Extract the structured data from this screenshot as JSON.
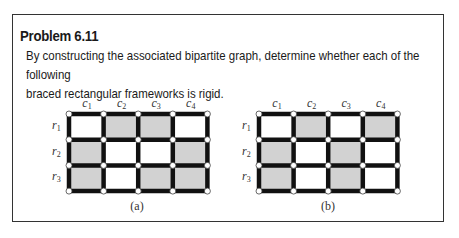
{
  "problem": {
    "title": "Problem 6.11",
    "text_lines": [
      "By constructing the associated bipartite graph, determine whether each of the following",
      "braced rectangular frameworks is rigid."
    ]
  },
  "figures": [
    {
      "caption": "(a)",
      "columns": [
        "c1",
        "c2",
        "c3",
        "c4"
      ],
      "rows": [
        "r1",
        "r2",
        "r3"
      ],
      "braced_cells": [
        [
          false,
          true,
          true,
          false
        ],
        [
          true,
          false,
          false,
          true
        ],
        [
          true,
          false,
          true,
          true
        ]
      ]
    },
    {
      "caption": "(b)",
      "columns": [
        "c1",
        "c2",
        "c3",
        "c4"
      ],
      "rows": [
        "r1",
        "r2",
        "r3"
      ],
      "braced_cells": [
        [
          false,
          true,
          false,
          true
        ],
        [
          true,
          false,
          true,
          false
        ],
        [
          true,
          false,
          true,
          false
        ]
      ]
    }
  ],
  "colors": {
    "braced_fill": "#d2d2d2",
    "unbraced_fill": "#ffffff",
    "bar": "#111111",
    "joint_fill": "#ffffff"
  }
}
